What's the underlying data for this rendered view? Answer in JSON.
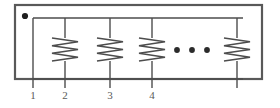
{
  "figure": {
    "background_color": "#ffffff",
    "line_color": "#4d4d4d",
    "enclosure_color": "#595959",
    "label_color": "#5a5a5a"
  },
  "enclosure": {
    "name": "device-enclosure-box",
    "x": 15,
    "y": 5,
    "width": 247,
    "height": 74,
    "stroke_width": 2.2
  },
  "terminal_marker": {
    "name": "polarity-dot-marker",
    "cx": 25,
    "cy": 16,
    "r": 3.1
  },
  "bus": {
    "name": "top-bus-wire",
    "x1": 33,
    "x2": 243,
    "y": 18,
    "stroke_width": 1.4
  },
  "bottom_rail": {
    "name": "bottom-rail-wire",
    "x1": 33,
    "x2": 243,
    "y": 79,
    "stroke_width": 1.4
  },
  "branches": [
    {
      "name": "branch-1",
      "x": 33,
      "label": "1",
      "has_resistor": false,
      "extends_below": true,
      "lead_bottom": 88
    },
    {
      "name": "branch-2",
      "x": 65,
      "label": "2",
      "has_resistor": true,
      "extends_below": true,
      "lead_bottom": 88
    },
    {
      "name": "branch-3",
      "x": 110,
      "label": "3",
      "has_resistor": true,
      "extends_below": true,
      "lead_bottom": 88
    },
    {
      "name": "branch-4",
      "x": 152,
      "label": "4",
      "has_resistor": true,
      "extends_below": true,
      "lead_bottom": 88
    },
    {
      "name": "branch-n",
      "x": 237,
      "label": "",
      "has_resistor": true,
      "extends_below": true,
      "lead_bottom": 88
    }
  ],
  "resistor": {
    "name": "resistor-zigzag-symbol",
    "top_y": 38,
    "bottom_y": 61,
    "amplitude": 13,
    "segments": 6,
    "stroke_width": 1.5
  },
  "ellipsis": {
    "name": "continuation-ellipsis",
    "cy": 50,
    "r": 2.9,
    "dots_x": [
      177,
      192,
      207
    ],
    "count": 3
  },
  "labels": {
    "name": "terminal-number-labels",
    "baseline_y": 99,
    "items": [
      {
        "text": "1",
        "x": 33
      },
      {
        "text": "2",
        "x": 65
      },
      {
        "text": "3",
        "x": 110
      },
      {
        "text": "4",
        "x": 152
      }
    ]
  }
}
